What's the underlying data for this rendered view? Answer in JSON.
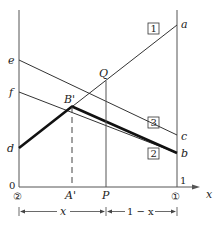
{
  "diagram": {
    "type": "phase-diagram-construction",
    "points": {
      "a": "a",
      "b": "b",
      "c": "c",
      "d": "d",
      "e": "e",
      "f": "f",
      "Q": "Q",
      "B_prime": "B'",
      "A_prime": "A'",
      "P": "P"
    },
    "boxed_labels": [
      "1",
      "2",
      "3"
    ],
    "axis": {
      "origin": "0",
      "right_tick": "1",
      "x_label": "x",
      "left_component": "②",
      "right_component": "①"
    },
    "dimensions": {
      "left_span": "x",
      "right_span": "1 − x"
    },
    "lines": [
      {
        "name": "line-1",
        "from": "d",
        "to": "a",
        "label": "1"
      },
      {
        "name": "line-2",
        "from": "f",
        "to": "b",
        "label": "2"
      },
      {
        "name": "line-3",
        "from": "e",
        "to": "c",
        "label": "3"
      }
    ]
  }
}
